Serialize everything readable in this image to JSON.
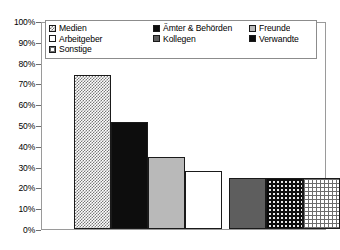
{
  "chart_data": {
    "type": "bar",
    "title": "",
    "subtitle": "",
    "xlabel": "",
    "ylabel": "",
    "ylim": [
      0,
      100
    ],
    "y_unit": "%",
    "grid": false,
    "legend_position": "top-inside",
    "categories": [
      "Medien",
      "Ämter & Behörden",
      "Freunde",
      "Arbeitgeber",
      "Kollegen",
      "Verwandte",
      "Sonstige"
    ],
    "values": [
      75,
      52,
      35,
      28,
      25,
      25,
      25
    ],
    "value_labels": [
      "75%",
      "52%",
      "35%",
      "28%",
      "25%",
      "25%",
      "25%"
    ],
    "fills": [
      "checker",
      "black",
      "lightgray",
      "white",
      "darkgray",
      "dots",
      "grid"
    ],
    "ytick_labels": [
      "100%",
      "90%",
      "80%",
      "70%",
      "60%",
      "50%",
      "40%",
      "30%",
      "20%",
      "10%",
      "0%"
    ],
    "ytick_values": [
      100,
      90,
      80,
      70,
      60,
      50,
      40,
      30,
      20,
      10,
      0
    ]
  },
  "legend": {
    "rows": [
      [
        {
          "label": "Medien",
          "fill": "checker"
        },
        {
          "label": "Ämter & Behörden",
          "fill": "black"
        },
        {
          "label": "Freunde",
          "fill": "lightgray"
        }
      ],
      [
        {
          "label": "Arbeitgeber",
          "fill": "white"
        },
        {
          "label": "Kollegen",
          "fill": "darkgray"
        },
        {
          "label": "Verwandte",
          "fill": "black"
        }
      ],
      [
        {
          "label": "Sonstige",
          "fill": "grid"
        }
      ]
    ]
  },
  "colors": {
    "axis": "#6f6f6f",
    "frame": "#9a9a9a",
    "bar_outline": "#1a1a1a",
    "black": "#0d0d0d",
    "dark_gray": "#5e5e5e",
    "light_gray": "#b9b9b9",
    "white": "#ffffff",
    "text": "#000000"
  }
}
